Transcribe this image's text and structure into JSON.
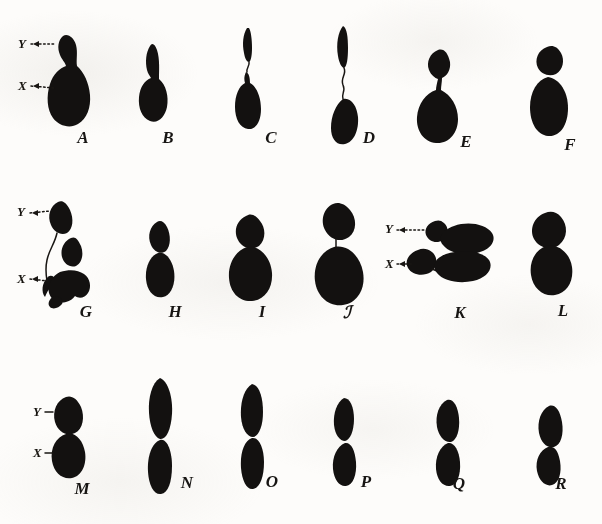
{
  "plate": {
    "title": "Chromosome figures plate",
    "description": "Eighteen ink drawings of chromosome pairs arranged in three rows of six, lettered A through R, with X and Y chromosome annotations",
    "background_color": "#fdfcfa",
    "ink_color": "#131110",
    "rows": 3,
    "columns": 6,
    "figure_count": 18
  },
  "figures": [
    {
      "id": "A",
      "label": "A",
      "row": 1,
      "col": 1,
      "annotations": [
        "Y",
        "X"
      ],
      "form": "small-Y-cap-over-large-ovoid-X"
    },
    {
      "id": "B",
      "label": "B",
      "row": 1,
      "col": 2,
      "annotations": [],
      "form": "slim-tapered-Y-over-ovoid-X"
    },
    {
      "id": "C",
      "label": "C",
      "row": 1,
      "col": 3,
      "annotations": [],
      "form": "detached-slim-Y-thread-over-elongate-X"
    },
    {
      "id": "D",
      "label": "D",
      "row": 1,
      "col": 4,
      "annotations": [],
      "form": "long-Y-thin-thread-long-X"
    },
    {
      "id": "E",
      "label": "E",
      "row": 1,
      "col": 5,
      "annotations": [],
      "form": "round-Y-short-stalk-broad-ovoid-X"
    },
    {
      "id": "F",
      "label": "F",
      "row": 1,
      "col": 6,
      "annotations": [],
      "form": "round-Y-abutting-long-ovoid-X"
    },
    {
      "id": "G",
      "label": "G",
      "row": 2,
      "col": 1,
      "annotations": [
        "Y",
        "X"
      ],
      "form": "displaced-Y-long-filament-clustered-X-mass"
    },
    {
      "id": "H",
      "label": "H",
      "row": 2,
      "col": 2,
      "annotations": [],
      "form": "small-Y-over-ovoid-X-narrow"
    },
    {
      "id": "I",
      "label": "I",
      "row": 2,
      "col": 3,
      "annotations": [],
      "form": "round-Y-over-large-round-X"
    },
    {
      "id": "J",
      "label": "ℐ",
      "row": 2,
      "col": 4,
      "annotations": [],
      "form": "oblique-Y-short-neck-large-round-X"
    },
    {
      "id": "K",
      "label": "K",
      "row": 2,
      "col": 5,
      "annotations": [
        "Y",
        "X"
      ],
      "form": "two-horizontal-pairs-rotated"
    },
    {
      "id": "L",
      "label": "L",
      "row": 2,
      "col": 6,
      "annotations": [],
      "form": "round-Y-over-round-X-stacked"
    },
    {
      "id": "M",
      "label": "M",
      "row": 3,
      "col": 1,
      "annotations": [
        "Y",
        "X"
      ],
      "form": "ovoid-Y-over-ovoid-X-waisted"
    },
    {
      "id": "N",
      "label": "N",
      "row": 3,
      "col": 2,
      "annotations": [],
      "form": "long-rod-pair-deep-waist"
    },
    {
      "id": "O",
      "label": "O",
      "row": 3,
      "col": 3,
      "annotations": [],
      "form": "long-rod-pair-narrow-waist"
    },
    {
      "id": "P",
      "label": "P",
      "row": 3,
      "col": 4,
      "annotations": [],
      "form": "short-rod-pair-pinched"
    },
    {
      "id": "Q",
      "label": "Q",
      "row": 3,
      "col": 5,
      "annotations": [],
      "form": "short-ovoid-pair"
    },
    {
      "id": "R",
      "label": "R",
      "row": 3,
      "col": 6,
      "annotations": [],
      "form": "short-ovoid-pair-offset"
    }
  ],
  "annotations": {
    "y_label": "Y",
    "x_label": "X",
    "leader_style": "dotted-with-arrowhead",
    "annotated_figures": [
      "A",
      "G",
      "K",
      "M"
    ]
  },
  "labels": {
    "A": "A",
    "B": "B",
    "C": "C",
    "D": "D",
    "E": "E",
    "F": "F",
    "G": "G",
    "H": "H",
    "I": "I",
    "J": "ℐ",
    "K": "K",
    "L": "L",
    "M": "M",
    "N": "N",
    "O": "O",
    "P": "P",
    "Q": "Q",
    "R": "R"
  }
}
